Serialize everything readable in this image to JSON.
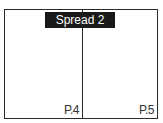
{
  "spread": {
    "label": "Spread 2",
    "pages": [
      {
        "label": "P.4"
      },
      {
        "label": "P.5"
      }
    ]
  },
  "colors": {
    "border": "#2a2a2a",
    "label_bg": "#1a1a1a",
    "label_text": "#ffffff"
  }
}
